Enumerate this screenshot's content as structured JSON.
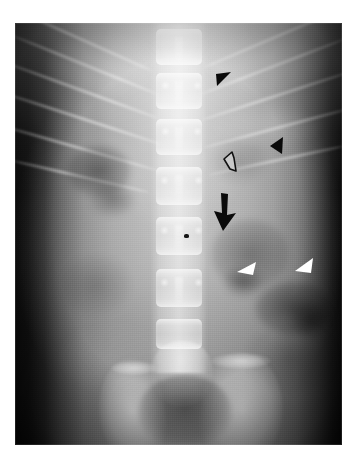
{
  "image": {
    "kind": "radiograph",
    "modality": "X-ray",
    "view": "abdominal plain film, anteroposterior (AP), supine",
    "region": "abdomen / lumbar spine and pelvis",
    "border_color": "#ffffff",
    "plate": {
      "x": 15,
      "y": 23,
      "width": 327,
      "height": 422
    }
  },
  "anatomy": {
    "structures": [
      "lumbar vertebral bodies",
      "intervertebral disc spaces",
      "spinous processes",
      "lower rib cage",
      "iliac wings",
      "sacrum",
      "sacroiliac joints",
      "pelvic inlet",
      "bowel gas shadows",
      "psoas shadow"
    ],
    "vertebrae_count": 6,
    "ribs_left_count": 6,
    "ribs_right_count": 5
  },
  "annotations": {
    "count": 6,
    "items": [
      {
        "id": "black-arrowhead-upper",
        "label": "black arrowhead",
        "style": "solid",
        "color": "#0a0a0a",
        "direction": "down-left",
        "x": 223,
        "y": 82,
        "size": 20
      },
      {
        "id": "black-arrowhead-lateral",
        "label": "black arrowhead",
        "style": "solid",
        "color": "#0a0a0a",
        "direction": "down-left",
        "x": 277,
        "y": 146,
        "size": 18
      },
      {
        "id": "open-arrow",
        "label": "open arrow",
        "style": "outline",
        "color": "#0a0a0a",
        "fill": "#c9c9c9",
        "direction": "left",
        "x": 231,
        "y": 163,
        "size": 18
      },
      {
        "id": "black-arrow-large",
        "label": "black arrow",
        "style": "solid-shaft",
        "color": "#0a0a0a",
        "direction": "down",
        "x": 225,
        "y": 212,
        "size": 34
      },
      {
        "id": "white-arrowhead-medial",
        "label": "white arrowhead",
        "style": "solid",
        "color": "#ffffff",
        "direction": "down-left",
        "x": 247,
        "y": 271,
        "size": 19
      },
      {
        "id": "white-arrowhead-lateral",
        "label": "white arrowhead",
        "style": "solid",
        "color": "#ffffff",
        "direction": "down-left",
        "x": 305,
        "y": 268,
        "size": 19
      }
    ]
  },
  "palette": {
    "page_background": "#ffffff",
    "film_dark": "#0d0d0d",
    "soft_tissue_mid": "#9a9a9a",
    "soft_tissue_bright": "#bdbdbd",
    "bone_highlight": "#f2f2f2",
    "marker_black": "#0a0a0a",
    "marker_white": "#ffffff"
  }
}
